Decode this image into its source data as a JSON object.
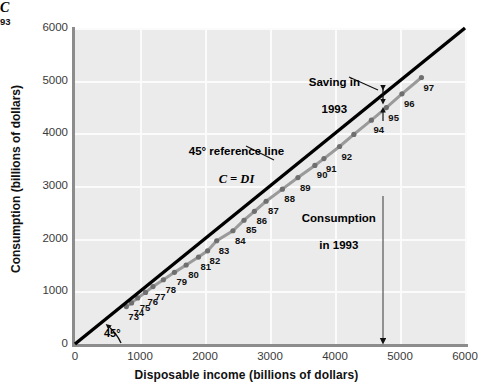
{
  "chart_data": {
    "type": "scatter",
    "title": "",
    "xlabel": "Disposable income (billions of dollars)",
    "ylabel": "Consumption (billions of dollars)",
    "xlim": [
      0,
      6000
    ],
    "ylim": [
      0,
      6000
    ],
    "xticks": [
      0,
      1000,
      2000,
      3000,
      4000,
      5000,
      6000
    ],
    "yticks": [
      0,
      1000,
      2000,
      3000,
      4000,
      5000,
      6000
    ],
    "grid": true,
    "legend_position": "none",
    "series": [
      {
        "name": "45 degree reference line  C = DI",
        "type": "line",
        "color": "#000000",
        "x": [
          0,
          6000
        ],
        "values": [
          0,
          6000
        ]
      },
      {
        "name": "C",
        "type": "scatter-line",
        "color": "#9a9a9a",
        "marker_color": "#6f6f6f",
        "points": [
          {
            "label": "73",
            "x": 790,
            "y": 710
          },
          {
            "label": "74",
            "x": 870,
            "y": 780
          },
          {
            "label": "75",
            "x": 965,
            "y": 875
          },
          {
            "label": "76",
            "x": 1085,
            "y": 980
          },
          {
            "label": "77",
            "x": 1200,
            "y": 1090
          },
          {
            "label": "78",
            "x": 1360,
            "y": 1220
          },
          {
            "label": "79",
            "x": 1530,
            "y": 1360
          },
          {
            "label": "80",
            "x": 1710,
            "y": 1500
          },
          {
            "label": "81",
            "x": 1900,
            "y": 1650
          },
          {
            "label": "82",
            "x": 2040,
            "y": 1770
          },
          {
            "label": "83",
            "x": 2180,
            "y": 1960
          },
          {
            "label": "84",
            "x": 2430,
            "y": 2150
          },
          {
            "label": "85",
            "x": 2600,
            "y": 2350
          },
          {
            "label": "86",
            "x": 2760,
            "y": 2520
          },
          {
            "label": "87",
            "x": 2940,
            "y": 2710
          },
          {
            "label": "88",
            "x": 3190,
            "y": 2940
          },
          {
            "label": "89",
            "x": 3430,
            "y": 3160
          },
          {
            "label": "90",
            "x": 3690,
            "y": 3390
          },
          {
            "label": "91",
            "x": 3830,
            "y": 3520
          },
          {
            "label": "92",
            "x": 4070,
            "y": 3750
          },
          {
            "label": "93",
            "x": 4290,
            "y": 3980
          },
          {
            "label": "94",
            "x": 4560,
            "y": 4250
          },
          {
            "label": "95",
            "x": 4790,
            "y": 4490
          },
          {
            "label": "96",
            "x": 5030,
            "y": 4750
          },
          {
            "label": "97",
            "x": 5330,
            "y": 5060
          }
        ]
      }
    ],
    "annotations": [
      {
        "name": "saving-1993",
        "text": "Saving in\n1993"
      },
      {
        "name": "reference-line",
        "text": "45° reference line\nC = DI"
      },
      {
        "name": "consumption-1993",
        "text": "Consumption\nin 1993"
      },
      {
        "name": "angle-45",
        "text": "45°"
      },
      {
        "name": "series-label-c",
        "text": "C"
      },
      {
        "name": "marker-93",
        "text": "93"
      }
    ]
  },
  "axes": {
    "x": {
      "title": "Disposable income (billions of dollars)",
      "ticks": [
        "0",
        "1000",
        "2000",
        "3000",
        "4000",
        "5000",
        "6000"
      ]
    },
    "y": {
      "title": "Consumption (billions of dollars)",
      "ticks": [
        "0",
        "1000",
        "2000",
        "3000",
        "4000",
        "5000",
        "6000"
      ]
    }
  },
  "annotations": {
    "saving_line1": "Saving in",
    "saving_line2": "1993",
    "reference_line1": "45° reference line",
    "reference_line2": "C = DI",
    "consumption_line1": "Consumption",
    "consumption_line2": "in 1993",
    "angle_45": "45°",
    "series_c": "C",
    "year_93": "93"
  },
  "colors": {
    "plot_background": "#ebebeb",
    "gridline": "#fbfbfb",
    "axis": "#8c8c8c",
    "reference_line": "#000000",
    "consumption_line": "#9a9a9a",
    "marker": "#6f6f6f",
    "text": "#111111"
  }
}
